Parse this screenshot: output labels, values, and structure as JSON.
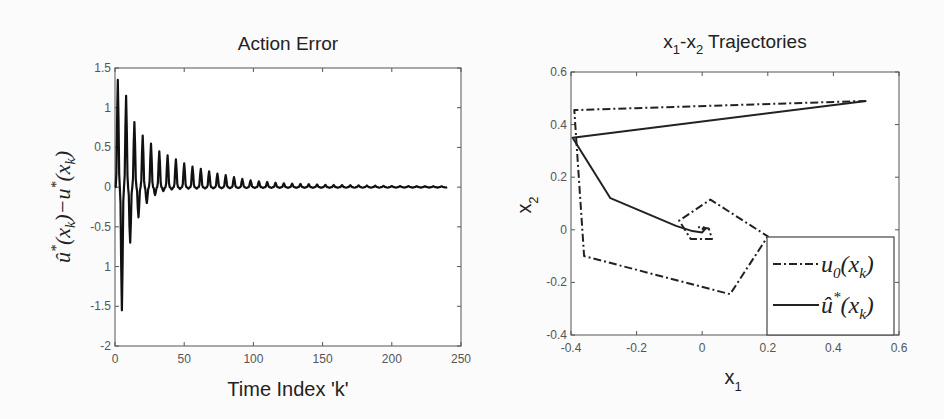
{
  "chart_data": [
    {
      "type": "line",
      "title": "Action Error",
      "xlabel": "Time Index 'k'",
      "ylabel": "û*(x_k) − u*(x_k)",
      "xlim": [
        0,
        250
      ],
      "ylim": [
        -2,
        1.5
      ],
      "xticks": [
        "0",
        "50",
        "100",
        "150",
        "200",
        "250"
      ],
      "yticks": [
        "1.5",
        "1",
        "0.5",
        "0",
        "-0.5",
        "1",
        "-1.5",
        "-2"
      ],
      "grid": false,
      "series": [
        {
          "name": "action error",
          "period": 6,
          "k_end": 240,
          "peaks": [
            [
              2,
              1.35
            ],
            [
              8,
              1.15
            ],
            [
              14,
              0.82
            ],
            [
              20,
              0.65
            ],
            [
              26,
              0.55
            ],
            [
              32,
              0.45
            ],
            [
              38,
              0.4
            ],
            [
              44,
              0.35
            ],
            [
              50,
              0.3
            ],
            [
              56,
              0.26
            ],
            [
              62,
              0.23
            ],
            [
              68,
              0.2
            ],
            [
              74,
              0.17
            ],
            [
              80,
              0.15
            ],
            [
              90,
              0.11
            ],
            [
              100,
              0.08
            ],
            [
              120,
              0.05
            ],
            [
              150,
              0.03
            ],
            [
              200,
              0.015
            ],
            [
              240,
              0.01
            ]
          ],
          "troughs": [
            [
              5,
              -1.55
            ],
            [
              11,
              -0.7
            ],
            [
              17,
              -0.38
            ],
            [
              23,
              -0.2
            ],
            [
              29,
              -0.1
            ],
            [
              35,
              -0.05
            ],
            [
              41,
              -0.03
            ],
            [
              50,
              -0.02
            ],
            [
              100,
              -0.01
            ],
            [
              240,
              -0.005
            ]
          ]
        }
      ]
    },
    {
      "type": "line",
      "title": "x1-x2 Trajectories",
      "xlabel": "x1",
      "ylabel": "x2",
      "xlim": [
        -0.4,
        0.6
      ],
      "ylim": [
        -0.4,
        0.6
      ],
      "xticks": [
        "-0.4",
        "-0.2",
        "0",
        "0.2",
        "0.4",
        "0.6"
      ],
      "yticks": [
        "0.6",
        "0.4",
        "0.2",
        "0",
        "-0.2",
        "-0.4"
      ],
      "grid": false,
      "legend": {
        "position": "lower right",
        "entries": [
          "u0(xk)",
          "û*(xk)"
        ]
      },
      "series": [
        {
          "name": "u0(xk)",
          "style": "dash-dot",
          "x": [
            0.5,
            -0.39,
            -0.36,
            0.085,
            0.2,
            0.025,
            -0.07,
            -0.035,
            0.03,
            0.02,
            -0.01,
            0.0
          ],
          "y": [
            0.49,
            0.455,
            -0.1,
            -0.245,
            -0.025,
            0.115,
            0.035,
            -0.035,
            -0.035,
            0.005,
            0.01,
            0.0
          ]
        },
        {
          "name": "û*(xk)",
          "style": "solid",
          "x": [
            0.5,
            -0.395,
            -0.28,
            -0.08,
            -0.03,
            0.0,
            0.01,
            0.005,
            0.0
          ],
          "y": [
            0.49,
            0.35,
            0.12,
            0.015,
            -0.005,
            -0.01,
            0.005,
            0.01,
            0.0
          ]
        }
      ]
    }
  ],
  "left": {
    "title": "Action Error",
    "xlabel": "Time Index 'k'",
    "ylabel_hat_u": "û",
    "ylabel_star": "*",
    "ylabel_mid": "(x",
    "ylabel_k": "k",
    "ylabel_close_minus": ")−u",
    "ylabel_close": ")"
  },
  "right": {
    "title_x": "x",
    "title_sub1": "1",
    "title_dash": "-x",
    "title_sub2": "2",
    "title_rest": " Trajectories",
    "xlabel": "x",
    "xlabel_sub": "1",
    "ylabel": "x",
    "ylabel_sub": "2",
    "legend": {
      "entry1_u": "u",
      "entry1_sub": "0",
      "entry1_rest": "(x",
      "entry1_k": "k",
      "entry1_close": ")",
      "entry2_u": "û",
      "entry2_star": "*",
      "entry2_rest": "(x",
      "entry2_k": "k",
      "entry2_close": ")"
    }
  }
}
